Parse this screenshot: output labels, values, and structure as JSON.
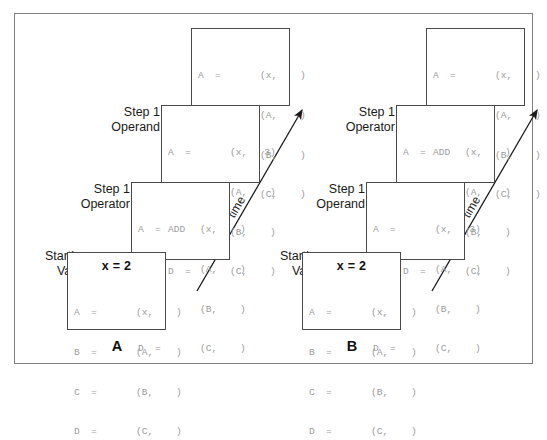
{
  "figure": {
    "background_color": "#ffffff",
    "frame_color": "#808080",
    "box_border_color": "#4a4a4a",
    "code_text_color": "#9b9b9b",
    "label_text_color": "#1a1a1a"
  },
  "code_rows": {
    "blank_x": {
      "lhs": "A  =",
      "op": "",
      "rhs": "(x,    )"
    },
    "add_x": {
      "lhs": "A  =",
      "op": "ADD",
      "rhs": "(x,    )"
    },
    "x_three": {
      "lhs": "A  =",
      "op": "",
      "rhs": "(x,   3)"
    },
    "b_row": {
      "lhs": "B  =",
      "op": "",
      "rhs": "(A,    )"
    },
    "c_row": {
      "lhs": "C  =",
      "op": "",
      "rhs": "(B,    )"
    },
    "d_row": {
      "lhs": "D  =",
      "op": "",
      "rhs": "(C,    )"
    }
  },
  "panels": [
    {
      "id": "panel-a",
      "letter": "A",
      "time_label": "time",
      "boxes": [
        {
          "name": "top-result-box",
          "stage_label": "",
          "header": "",
          "lines": [
            {
              "lhs": "A  =",
              "op": "",
              "rhs": "(x,    )"
            },
            {
              "lhs": "B  =",
              "op": "",
              "rhs": "(A,    )"
            },
            {
              "lhs": "C  =",
              "op": "",
              "rhs": "(B,    )"
            },
            {
              "lhs": "D  =",
              "op": "",
              "rhs": "(C,    )"
            }
          ]
        },
        {
          "name": "step1-operand-box",
          "stage_label": "Step 1\nOperand",
          "header": "",
          "lines": [
            {
              "lhs": "A  =",
              "op": "",
              "rhs": "(x,   3)"
            },
            {
              "lhs": "B  =",
              "op": "",
              "rhs": "(A,    )"
            },
            {
              "lhs": "C  =",
              "op": "",
              "rhs": "(B,    )"
            },
            {
              "lhs": "D  =",
              "op": "",
              "rhs": "(C,    )"
            }
          ]
        },
        {
          "name": "step1-operator-box",
          "stage_label": "Step 1\nOperator",
          "header": "",
          "lines": [
            {
              "lhs": "A  =",
              "op": "ADD",
              "rhs": "(x,    )"
            },
            {
              "lhs": "B  =",
              "op": "",
              "rhs": "(A,    )"
            },
            {
              "lhs": "C  =",
              "op": "",
              "rhs": "(B,    )"
            },
            {
              "lhs": "D  =",
              "op": "",
              "rhs": "(C,    )"
            }
          ]
        },
        {
          "name": "starting-value-box",
          "stage_label": "Starting\nValue",
          "header": "x = 2",
          "lines": [
            {
              "lhs": "A  =",
              "op": "",
              "rhs": "(x,    )"
            },
            {
              "lhs": "B  =",
              "op": "",
              "rhs": "(A,    )"
            },
            {
              "lhs": "C  =",
              "op": "",
              "rhs": "(B,    )"
            },
            {
              "lhs": "D  =",
              "op": "",
              "rhs": "(C,    )"
            }
          ]
        }
      ]
    },
    {
      "id": "panel-b",
      "letter": "B",
      "time_label": "time",
      "boxes": [
        {
          "name": "top-result-box",
          "stage_label": "",
          "header": "",
          "lines": [
            {
              "lhs": "A  =",
              "op": "",
              "rhs": "(x,    )"
            },
            {
              "lhs": "B  =",
              "op": "",
              "rhs": "(A,    )"
            },
            {
              "lhs": "C  =",
              "op": "",
              "rhs": "(B,    )"
            },
            {
              "lhs": "D  =",
              "op": "",
              "rhs": "(C,    )"
            }
          ]
        },
        {
          "name": "step1-operator-box",
          "stage_label": "Step 1\nOperator",
          "header": "",
          "lines": [
            {
              "lhs": "A  =",
              "op": "ADD",
              "rhs": "(x,    )"
            },
            {
              "lhs": "B  =",
              "op": "",
              "rhs": "(A,    )"
            },
            {
              "lhs": "C  =",
              "op": "",
              "rhs": "(B,    )"
            },
            {
              "lhs": "D  =",
              "op": "",
              "rhs": "(C,    )"
            }
          ]
        },
        {
          "name": "step1-operand-box",
          "stage_label": "Step 1\nOperand",
          "header": "",
          "lines": [
            {
              "lhs": "A  =",
              "op": "",
              "rhs": "(x,   3)"
            },
            {
              "lhs": "B  =",
              "op": "",
              "rhs": "(A,    )"
            },
            {
              "lhs": "C  =",
              "op": "",
              "rhs": "(B,    )"
            },
            {
              "lhs": "D  =",
              "op": "",
              "rhs": "(C,    )"
            }
          ]
        },
        {
          "name": "starting-value-box",
          "stage_label": "Starting\nValue",
          "header": "x = 2",
          "lines": [
            {
              "lhs": "A  =",
              "op": "",
              "rhs": "(x,    )"
            },
            {
              "lhs": "B  =",
              "op": "",
              "rhs": "(A,    )"
            },
            {
              "lhs": "C  =",
              "op": "",
              "rhs": "(B,    )"
            },
            {
              "lhs": "D  =",
              "op": "",
              "rhs": "(C,    )"
            }
          ]
        }
      ]
    }
  ]
}
